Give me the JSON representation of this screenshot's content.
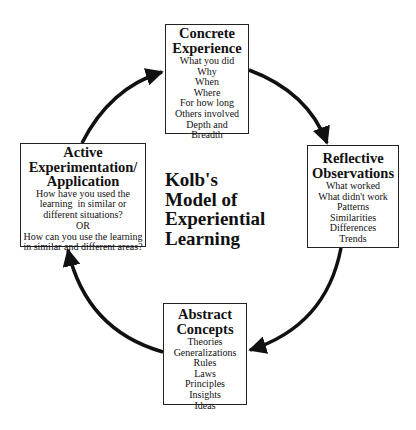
{
  "diagram": {
    "title_lines": [
      "Kolb's",
      "Model of",
      "Experiential",
      "Learning"
    ],
    "stages": [
      {
        "id": "concrete-experience",
        "title_lines": [
          "Concrete",
          "Experience"
        ],
        "items": [
          "What you did",
          "Why",
          "When",
          "Where",
          "For how long",
          "Others involved",
          "Depth and",
          "Breadth"
        ]
      },
      {
        "id": "reflective-observations",
        "title_lines": [
          "Reflective",
          "Observations"
        ],
        "items": [
          "What worked",
          "What didn't work",
          "Patterns",
          "Similarities",
          "Differences",
          "Trends"
        ]
      },
      {
        "id": "abstract-concepts",
        "title_lines": [
          "Abstract",
          "Concepts"
        ],
        "items": [
          "Theories",
          "Generalizations",
          "Rules",
          "Laws",
          "Principles",
          "Insights",
          "Ideas"
        ]
      },
      {
        "id": "active-experimentation",
        "title_lines": [
          "Active",
          "Experimentation/",
          "Application"
        ],
        "items": [
          "How have you used the",
          "learning  in similar or",
          "different situations?",
          "OR",
          "How can you use the learning",
          "in similar and different areas?"
        ]
      }
    ],
    "cycle_direction": "clockwise",
    "colors": {
      "stroke": "#111111",
      "background": "#ffffff"
    }
  }
}
